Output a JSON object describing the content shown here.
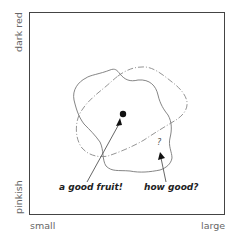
{
  "diagram": {
    "axes": {
      "x_left_label": "small",
      "x_right_label": "large",
      "y_top_label": "dark red",
      "y_bottom_label": "pinkish"
    },
    "annotations": {
      "good_fruit": "a good fruit!",
      "how_good": "how good?",
      "question_mark": "?"
    },
    "regions": [
      {
        "name": "solid-region",
        "style": "solid"
      },
      {
        "name": "dashed-region",
        "style": "dash-dot"
      }
    ],
    "colors": {
      "frame": "#444444",
      "curve": "#777777",
      "text": "#222222",
      "axis_text": "#666666"
    }
  }
}
